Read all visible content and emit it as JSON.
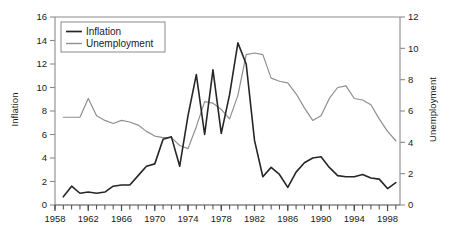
{
  "chart_data": {
    "type": "line",
    "title": "",
    "xlabel": "",
    "x": [
      1959,
      1960,
      1961,
      1962,
      1963,
      1964,
      1965,
      1966,
      1967,
      1968,
      1969,
      1970,
      1971,
      1972,
      1973,
      1974,
      1975,
      1976,
      1977,
      1978,
      1979,
      1980,
      1981,
      1982,
      1983,
      1984,
      1985,
      1986,
      1987,
      1988,
      1989,
      1990,
      1991,
      1992,
      1993,
      1994,
      1995,
      1996,
      1997,
      1998,
      1999
    ],
    "xlim": [
      1958,
      1999.5
    ],
    "xticks_major": [
      1958,
      1962,
      1966,
      1970,
      1974,
      1978,
      1982,
      1986,
      1990,
      1994,
      1998
    ],
    "xticklabels": [
      "1958",
      "1962",
      "1966",
      "1970",
      "1974",
      "1978",
      "1982",
      "1986",
      "1990",
      "1994",
      "1998"
    ],
    "xtick_interval_minor": 1,
    "grid": false,
    "legend_position": "top-left",
    "series": [
      {
        "name": "Inflation",
        "axis": "left",
        "color": "#262626",
        "linewidth": 1.6,
        "ylabel": "Inflation",
        "ylim": [
          0,
          16
        ],
        "yticks": [
          0,
          2,
          4,
          6,
          8,
          10,
          12,
          14,
          16
        ],
        "yticklabels": [
          "0",
          "2",
          "4",
          "6",
          "8",
          "10",
          "12",
          "14",
          "16"
        ],
        "values": [
          0.7,
          1.6,
          1.0,
          1.1,
          1.0,
          1.1,
          1.6,
          1.7,
          1.7,
          2.5,
          3.3,
          3.5,
          5.6,
          5.8,
          3.3,
          7.6,
          11.1,
          6.0,
          11.5,
          6.1,
          9.4,
          13.8,
          12.0,
          5.5,
          2.4,
          3.2,
          2.6,
          1.5,
          2.8,
          3.6,
          4.0,
          4.1,
          3.2,
          2.5,
          2.4,
          2.4,
          2.6,
          2.3,
          2.2,
          1.4,
          1.9
        ]
      },
      {
        "name": "Unemployment",
        "axis": "right",
        "color": "#8f8f8f",
        "linewidth": 1.2,
        "ylabel": "Unemployment",
        "ylim": [
          0,
          12
        ],
        "yticks": [
          0,
          2,
          4,
          6,
          8,
          10,
          12
        ],
        "yticklabels": [
          "0",
          "2",
          "4",
          "6",
          "8",
          "10",
          "12"
        ],
        "values": [
          5.6,
          5.6,
          5.6,
          6.8,
          5.7,
          5.4,
          5.2,
          5.4,
          5.3,
          5.1,
          4.7,
          4.4,
          4.3,
          4.3,
          3.8,
          3.6,
          5.0,
          6.6,
          6.5,
          6.1,
          5.5,
          7.0,
          9.6,
          9.7,
          9.6,
          8.1,
          7.9,
          7.8,
          7.1,
          6.2,
          5.4,
          5.7,
          6.8,
          7.5,
          7.6,
          6.8,
          6.7,
          6.4,
          5.5,
          4.7,
          4.1
        ]
      }
    ]
  },
  "legend": {
    "entries": [
      {
        "label": "Inflation"
      },
      {
        "label": "Unemployment"
      }
    ]
  },
  "axes": {
    "left_title": "Inflation",
    "right_title": "Unemployment"
  }
}
